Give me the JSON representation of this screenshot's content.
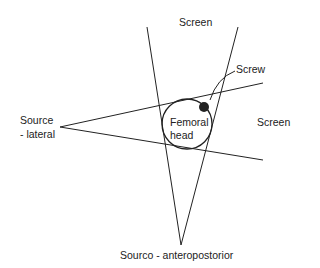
{
  "labels": {
    "screen_top": "Screen",
    "screen_right": "Screen",
    "screw": "Screw",
    "source_lateral_line1": "Source",
    "source_lateral_line2": "- lateral",
    "femoral_line1": "Femoral",
    "femoral_line2": "head",
    "source_ap": "Sourco - anteropostorior"
  },
  "colors": {
    "stroke": "#222222",
    "background": "#ffffff"
  },
  "geometry": {
    "ap_source": [
      181,
      245
    ],
    "ap_left_top": [
      147,
      27
    ],
    "ap_right_top": [
      238,
      27
    ],
    "lateral_source": [
      60,
      127
    ],
    "lateral_upper_end": [
      263,
      83
    ],
    "lateral_lower_end": [
      263,
      160
    ],
    "femoral_head_center": [
      187,
      124
    ],
    "femoral_head_radius": 25,
    "screw_center": [
      204,
      107
    ],
    "screw_radius": 5
  }
}
